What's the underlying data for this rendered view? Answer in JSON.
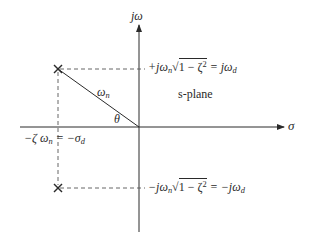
{
  "diagram": {
    "title": "s-plane",
    "axes": {
      "horizontal_label": "σ",
      "vertical_label": "jω"
    },
    "poles": [
      {
        "name": "upper-pole",
        "marker": "×",
        "label_pre": "+jω",
        "label_sub": "n",
        "label_root": "1 − ζ",
        "label_exp": "2",
        "label_eq": " = jω",
        "label_eq_sub": "d"
      },
      {
        "name": "lower-pole",
        "marker": "×",
        "label_pre": "−jω",
        "label_sub": "n",
        "label_root": "1 − ζ",
        "label_exp": "2",
        "label_eq": " = −jω",
        "label_eq_sub": "d"
      }
    ],
    "radius_label": "ω",
    "radius_label_sub": "n",
    "angle_label": "θ",
    "real_part_label": {
      "pre": "−ζ ω",
      "sub": "n",
      "mid": " = −σ",
      "sub2": "d"
    },
    "plane_label": "s-plane",
    "colors": {
      "line": "#2a2a2a",
      "dashed": "#555555",
      "background": "#ffffff"
    }
  }
}
